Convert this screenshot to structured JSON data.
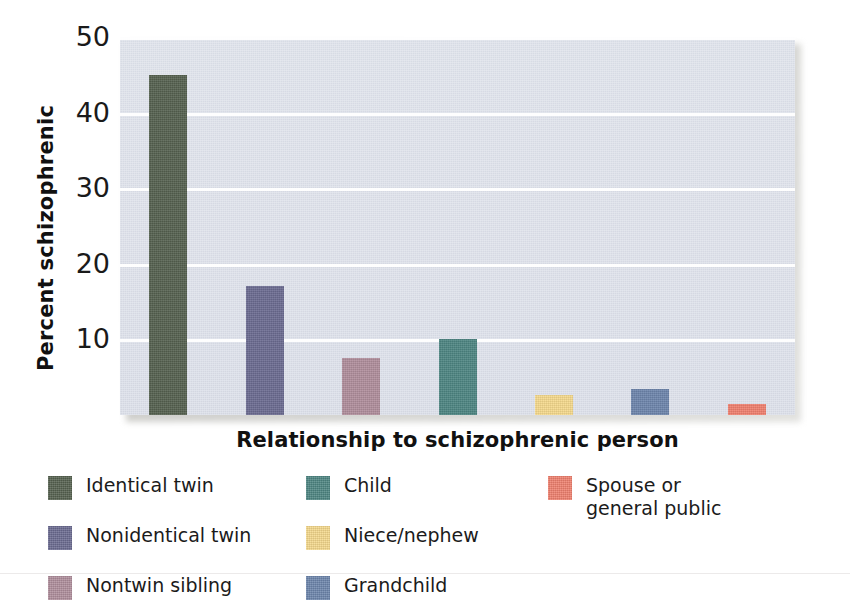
{
  "chart_data": {
    "type": "bar",
    "title": "",
    "xlabel": "Relationship to schizophrenic person",
    "ylabel": "Percent schizophrenic",
    "categories": [
      "Identical twin",
      "Nonidentical twin",
      "Nontwin sibling",
      "Child",
      "Niece/nephew",
      "Grandchild",
      "Spouse or general public"
    ],
    "values": [
      45,
      17,
      7.5,
      10,
      2.7,
      3.5,
      1.5
    ],
    "colors": [
      "#55614f",
      "#6b6b91",
      "#b08e9c",
      "#4d8582",
      "#f5d98c",
      "#6d85ac",
      "#f0806e"
    ],
    "ylim": [
      0,
      50
    ],
    "yticks": [
      10,
      20,
      30,
      40,
      50
    ],
    "ytick_labels": [
      "10",
      "20",
      "30",
      "40",
      "50"
    ],
    "grid": true,
    "legend_position": "bottom",
    "plot_background": "#dce0ea",
    "gridline_color": "#ffffff"
  },
  "legend": {
    "columns": [
      {
        "items": [
          {
            "label": "Identical twin",
            "color": "#55614f",
            "swatch_name": "legend-swatch-identical-twin"
          },
          {
            "label": "Nonidentical twin",
            "color": "#6b6b91",
            "swatch_name": "legend-swatch-nonidentical-twin"
          },
          {
            "label": "Nontwin sibling",
            "color": "#b08e9c",
            "swatch_name": "legend-swatch-nontwin-sibling"
          }
        ]
      },
      {
        "items": [
          {
            "label": "Child",
            "color": "#4d8582",
            "swatch_name": "legend-swatch-child"
          },
          {
            "label": "Niece/nephew",
            "color": "#f5d98c",
            "swatch_name": "legend-swatch-niece-nephew"
          },
          {
            "label": "Grandchild",
            "color": "#6d85ac",
            "swatch_name": "legend-swatch-grandchild"
          }
        ]
      },
      {
        "items": [
          {
            "label": "Spouse or\ngeneral public",
            "color": "#f0806e",
            "swatch_name": "legend-swatch-spouse-general-public"
          }
        ]
      }
    ]
  }
}
